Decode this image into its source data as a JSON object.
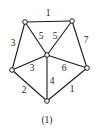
{
  "diagram": {
    "type": "weighted-undirected-graph",
    "caption": "(1)",
    "nodes": [
      {
        "id": "A",
        "x": 25,
        "y": 22
      },
      {
        "id": "B",
        "x": 72,
        "y": 21
      },
      {
        "id": "C",
        "x": 47,
        "y": 55
      },
      {
        "id": "D",
        "x": 12,
        "y": 70
      },
      {
        "id": "E",
        "x": 87,
        "y": 68
      },
      {
        "id": "F",
        "x": 47,
        "y": 101
      }
    ],
    "edges": [
      {
        "from": "A",
        "to": "B",
        "weight": "1",
        "lx": 48,
        "ly": 14
      },
      {
        "from": "A",
        "to": "D",
        "weight": "3",
        "lx": 13,
        "ly": 44
      },
      {
        "from": "A",
        "to": "C",
        "weight": "5",
        "lx": 41,
        "ly": 37
      },
      {
        "from": "B",
        "to": "C",
        "weight": "5",
        "lx": 55,
        "ly": 37
      },
      {
        "from": "B",
        "to": "E",
        "weight": "7",
        "lx": 86,
        "ly": 41
      },
      {
        "from": "C",
        "to": "D",
        "weight": "3",
        "lx": 32,
        "ly": 69
      },
      {
        "from": "C",
        "to": "E",
        "weight": "6",
        "lx": 64,
        "ly": 69
      },
      {
        "from": "C",
        "to": "F",
        "weight": "4",
        "lx": 52,
        "ly": 82
      },
      {
        "from": "D",
        "to": "F",
        "weight": "2",
        "lx": 24,
        "ly": 91
      },
      {
        "from": "E",
        "to": "F",
        "weight": "1",
        "lx": 72,
        "ly": 90
      }
    ]
  }
}
